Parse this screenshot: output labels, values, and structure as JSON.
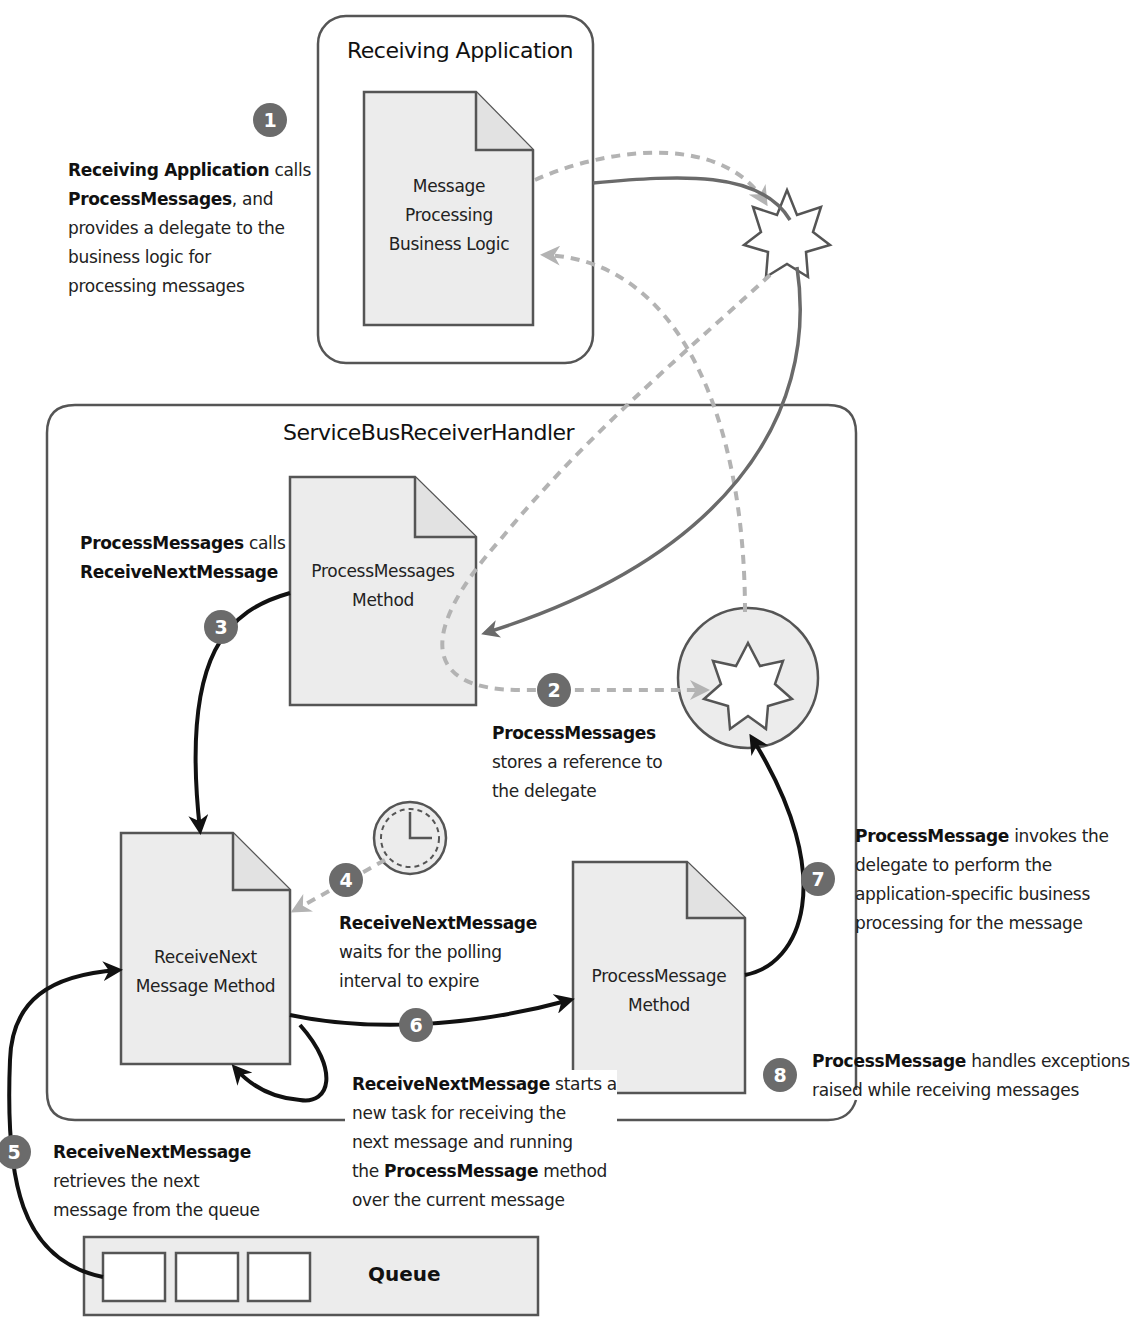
{
  "containers": {
    "receiving_app": {
      "title": "Receiving Application"
    },
    "handler": {
      "title": "ServiceBusReceiverHandler"
    },
    "queue": {
      "label": "Queue",
      "slots": 3
    }
  },
  "documents": {
    "business_logic": {
      "line1": "Message",
      "line2": "Processing",
      "line3": "Business Logic"
    },
    "process_messages": {
      "line1": "ProcessMessages",
      "line2": "Method"
    },
    "receive_next": {
      "line1": "ReceiveNext",
      "line2": "Message Method"
    },
    "process_message": {
      "line1": "ProcessMessage",
      "line2": "Method"
    }
  },
  "icons": {
    "delegate_star": "delegate-star-icon",
    "stored_delegate": "stored-delegate-icon",
    "clock": "clock-icon"
  },
  "steps": [
    {
      "num": "1",
      "bold": "Receiving Application",
      "lines": [
        " calls",
        "ProcessMessages",
        ", and",
        "provides a delegate to the",
        "business logic for",
        "processing messages"
      ]
    },
    {
      "num": "2",
      "bold": "ProcessMessages",
      "lines": [
        "stores a reference to",
        "the delegate"
      ]
    },
    {
      "num": "3",
      "bold": "ProcessMessages",
      "lines": [
        " calls",
        "ReceiveNextMessage"
      ]
    },
    {
      "num": "4",
      "bold": "ReceiveNextMessage",
      "lines": [
        "waits for the polling",
        "interval to expire"
      ]
    },
    {
      "num": "5",
      "bold": "ReceiveNextMessage",
      "lines": [
        "retrieves the next",
        "message from the queue"
      ]
    },
    {
      "num": "6",
      "bold": "ReceiveNextMessage",
      "lines": [
        " starts a",
        "new task for receiving the",
        "next message and running",
        "the ",
        "ProcessMessage",
        " method",
        "over the current message"
      ]
    },
    {
      "num": "7",
      "bold": "ProcessMessage",
      "lines": [
        " invokes the",
        "delegate to perform the",
        "application-specific business",
        "processing for the message"
      ]
    },
    {
      "num": "8",
      "bold": "ProcessMessage",
      "lines": [
        " handles exceptions",
        "raised while receiving messages"
      ]
    }
  ],
  "colors": {
    "badge": "#6b6b6b",
    "doc_fill": "#ececec",
    "solid_arrow": "#111111",
    "gray_arrow": "#6a6a6a",
    "dashed_arrow": "#b3b3b3",
    "border": "#555555"
  }
}
